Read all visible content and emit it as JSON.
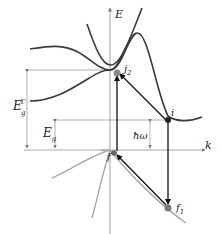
{
  "axes": {
    "y_label": "E",
    "x_label": "k"
  },
  "labels": {
    "gap_direct": {
      "main": "E",
      "sub": "g",
      "sup": "Γ"
    },
    "gap_indirect": {
      "main": "E",
      "sub": "g"
    },
    "photon": "ħω",
    "point_i": "i",
    "point_f": "f",
    "point_j2": {
      "main": "j",
      "sub": "2"
    },
    "point_f1": {
      "main": "f",
      "sub": "1"
    }
  },
  "colors": {
    "curve": "#3a3a3a",
    "valence_light": "#a8a8a8",
    "guide": "#8c8c8c",
    "arrow": "#111111",
    "point": "#555555"
  }
}
